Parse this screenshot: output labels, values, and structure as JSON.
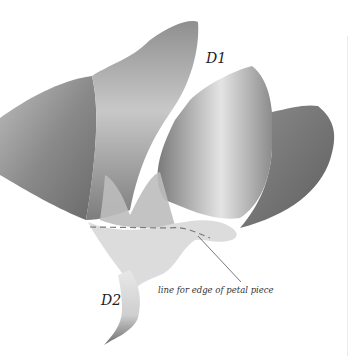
{
  "illustration": {
    "subject": "watercolor flower with petals and stem",
    "labels": {
      "d1": "D1",
      "d2": "D2",
      "callout": "line for edge of petal piece"
    },
    "colors": {
      "background": "#ffffff",
      "petal_dark": "#6f6f6f",
      "petal_mid": "#9a9a9a",
      "petal_light": "#d6d6d6",
      "dashed_line": "#7a7a7a",
      "leader_line": "#555555"
    }
  }
}
